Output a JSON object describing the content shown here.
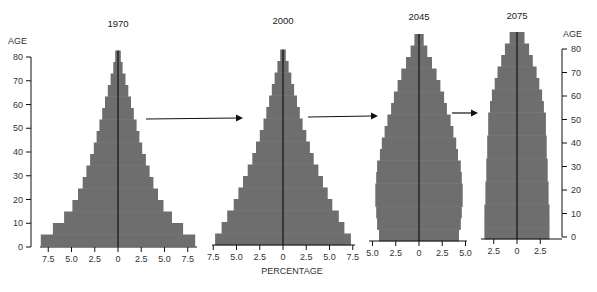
{
  "chart_data": {
    "type": "bar",
    "subtype": "population-pyramid",
    "xlabel": "PERCENTAGE",
    "ylabel": "AGE",
    "age_ticks": [
      0,
      10,
      20,
      30,
      40,
      50,
      60,
      70,
      80
    ],
    "age_bands": [
      "0-4",
      "5-9",
      "10-14",
      "15-19",
      "20-24",
      "25-29",
      "30-34",
      "35-39",
      "40-44",
      "45-49",
      "50-54",
      "55-59",
      "60-64",
      "65-69",
      "70-74",
      "75-79",
      "80-84"
    ],
    "colors": {
      "bar": "#6e6e6e",
      "axis": "#111111",
      "text": "#333333"
    },
    "series": [
      {
        "name": "1970",
        "x_ticks": [
          "7.5",
          "5.0",
          "2.5",
          "0",
          "2.5",
          "5.0",
          "7.5"
        ],
        "percent_each_side": [
          8.3,
          7.0,
          5.8,
          4.9,
          4.3,
          3.8,
          3.4,
          3.0,
          2.6,
          2.3,
          2.0,
          1.7,
          1.4,
          1.1,
          0.8,
          0.5,
          0.3
        ]
      },
      {
        "name": "2000",
        "x_ticks": [
          "7.5",
          "5.0",
          "2.5",
          "0",
          "2.5",
          "5.0",
          "7.5"
        ],
        "percent_each_side": [
          7.3,
          6.6,
          6.0,
          5.3,
          4.8,
          4.3,
          3.8,
          3.3,
          2.9,
          2.5,
          2.1,
          1.8,
          1.5,
          1.2,
          0.9,
          0.6,
          0.3
        ]
      },
      {
        "name": "2045",
        "x_ticks": [
          "5.0",
          "2.5",
          "0",
          "2.5",
          "5.0"
        ],
        "percent_each_side": [
          4.3,
          4.5,
          4.6,
          4.7,
          4.7,
          4.6,
          4.5,
          4.2,
          4.0,
          3.7,
          3.4,
          3.0,
          2.7,
          2.3,
          1.9,
          1.4,
          0.9,
          0.5
        ]
      },
      {
        "name": "2075",
        "x_ticks": [
          "2.5",
          "0",
          "2.5"
        ],
        "percent_each_side": [
          3.5,
          3.5,
          3.5,
          3.4,
          3.4,
          3.3,
          3.3,
          3.2,
          3.2,
          3.1,
          3.1,
          2.9,
          2.7,
          2.4,
          2.1,
          1.7,
          1.3,
          0.8
        ]
      }
    ],
    "annotations": [
      "arrow 1970→2000",
      "arrow 2000→2045",
      "arrow 2045→2075"
    ],
    "axis": {
      "age_range": [
        0,
        85
      ],
      "left_age_axis": true,
      "right_age_axis": true,
      "grid": false
    }
  }
}
